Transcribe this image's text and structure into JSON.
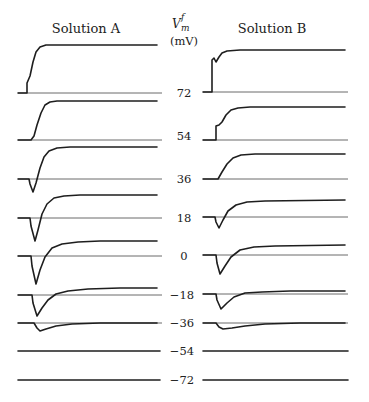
{
  "figure": {
    "panel_a_title": "Solution A",
    "panel_b_title": "Solution B",
    "axis_label": {
      "symbol": "V",
      "subscript": "m",
      "superscript": "f",
      "unit": "(mV)"
    },
    "voltage_levels": [
      "72",
      "54",
      "36",
      "18",
      "0",
      "−18",
      "−36",
      "−54",
      "−72"
    ]
  },
  "traces": {
    "solution_a": [
      {
        "level": "72",
        "baseline_y": 93,
        "path": "M18,93 L27,93 L27,83 L30,76 L33,62 L36,52 L40,47 L46,45 L157,45"
      },
      {
        "level": "54",
        "baseline_y": 140,
        "path": "M18,140 L31,140 L34,136 L37,125 L41,113 L45,105 L50,102 L57,101 L157,101"
      },
      {
        "level": "36",
        "baseline_y": 179,
        "path": "M18,179 L29,179 L30,184 L33,192 L36,183 L40,168 L44,157 L49,151 L57,148 L70,147 L157,147"
      },
      {
        "level": "18",
        "baseline_y": 218,
        "path": "M18,218 L30,218 L31,226 L35,241 L38,230 L42,214 L47,204 L54,198 L64,196 L80,195 L157,195"
      },
      {
        "level": "0",
        "baseline_y": 256,
        "path": "M18,256 L31,256 L32,266 L36,284 L40,270 L45,257 L52,248 L62,244 L78,242 L100,241 L157,241"
      },
      {
        "level": "−18",
        "baseline_y": 295,
        "path": "M18,295 L32,295 L33,303 L37,316 L42,308 L48,300 L56,294 L68,291 L88,289 L120,288 L157,288"
      },
      {
        "level": "−36",
        "baseline_y": 323,
        "path": "M18,323 L34,323 L37,328 L40,331 L46,329 L56,326 L72,324 L100,323 L157,323"
      },
      {
        "level": "−54",
        "baseline_y": 351,
        "path": "M18,351 L160,351"
      },
      {
        "level": "−72",
        "baseline_y": 380,
        "path": "M18,380 L160,380"
      }
    ],
    "solution_b": [
      {
        "level": "72",
        "baseline_y": 92,
        "path": "M203,92 L212,92 L212,60 L214,58 L216,62 L219,57 L222,53 L227,51 L240,50 L345,50"
      },
      {
        "level": "54",
        "baseline_y": 140,
        "path": "M203,140 L216,140 L216,126 L219,125 L222,122 L226,115 L231,110 L238,108 L250,107 L345,107"
      },
      {
        "level": "36",
        "baseline_y": 179,
        "path": "M203,179 L218,179 L222,172 L227,164 L233,158 L241,155 L255,154 L345,154"
      },
      {
        "level": "18",
        "baseline_y": 217,
        "path": "M203,217 L215,217 L216,222 L219,228 L223,220 L228,211 L236,205 L247,202 L265,201 L345,200"
      },
      {
        "level": "0",
        "baseline_y": 255,
        "path": "M203,255 L216,255 L217,263 L220,274 L225,266 L231,257 L240,250 L254,247 L275,246 L345,245"
      },
      {
        "level": "−18",
        "baseline_y": 294,
        "path": "M203,294 L216,294 L217,300 L221,309 L227,303 L234,297 L245,293 L262,292 L290,291 L345,291"
      },
      {
        "level": "−36",
        "baseline_y": 323,
        "path": "M203,323 L216,323 L219,327 L223,329 L232,328 L245,326 L265,324 L300,323 L345,323"
      },
      {
        "level": "−54",
        "baseline_y": 351,
        "path": "M203,351 L348,351"
      },
      {
        "level": "−72",
        "baseline_y": 380,
        "path": "M203,380 L348,380"
      }
    ]
  }
}
